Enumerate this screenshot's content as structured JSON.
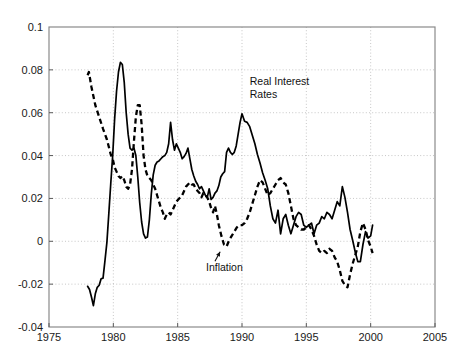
{
  "figure": {
    "width": 468,
    "height": 364,
    "background": "#ffffff",
    "plot_area": {
      "left": 49,
      "top": 27,
      "right": 435,
      "bottom": 327
    }
  },
  "annotations": {
    "real_rates_line1": "Real Interest",
    "real_rates_line2": "Rates",
    "inflation_label": "Inflation"
  },
  "chart_data": {
    "type": "line",
    "title": "",
    "xlabel": "",
    "ylabel": "",
    "xlim": [
      1975,
      2005
    ],
    "ylim": [
      -0.04,
      0.1
    ],
    "grid": true,
    "legend_position": "inline-annotation",
    "xticks": [
      1975,
      1980,
      1985,
      1990,
      1995,
      2000,
      2005
    ],
    "xtick_labels": [
      "1975",
      "1980",
      "1985",
      "1990",
      "1995",
      "2000",
      "2005"
    ],
    "yticks": [
      -0.04,
      -0.02,
      0,
      0.02,
      0.04,
      0.06,
      0.08,
      0.1
    ],
    "ytick_labels": [
      "-0.04",
      "-0.02",
      "0",
      "0.02",
      "0.04",
      "0.06",
      "0.08",
      "0.1"
    ],
    "series": [
      {
        "name": "Real Interest Rates",
        "style": "solid",
        "color": "#000000",
        "x": [
          1978.0,
          1978.15,
          1978.3,
          1978.45,
          1978.6,
          1978.75,
          1978.9,
          1979.05,
          1979.2,
          1979.35,
          1979.5,
          1979.65,
          1979.8,
          1979.95,
          1980.1,
          1980.25,
          1980.4,
          1980.55,
          1980.7,
          1980.85,
          1981.0,
          1981.15,
          1981.3,
          1981.45,
          1981.6,
          1981.75,
          1981.9,
          1982.05,
          1982.2,
          1982.35,
          1982.5,
          1982.65,
          1982.8,
          1982.95,
          1983.1,
          1983.25,
          1983.4,
          1983.55,
          1983.7,
          1983.85,
          1984.0,
          1984.15,
          1984.3,
          1984.45,
          1984.6,
          1984.75,
          1984.9,
          1985.05,
          1985.2,
          1985.35,
          1985.5,
          1985.65,
          1985.8,
          1985.95,
          1986.1,
          1986.25,
          1986.4,
          1986.55,
          1986.7,
          1986.85,
          1987.0,
          1987.15,
          1987.3,
          1987.45,
          1987.6,
          1987.75,
          1987.9,
          1988.05,
          1988.2,
          1988.35,
          1988.5,
          1988.65,
          1988.8,
          1988.95,
          1989.1,
          1989.25,
          1989.4,
          1989.55,
          1989.7,
          1989.85,
          1990.0,
          1990.2,
          1990.4,
          1990.6,
          1990.8,
          1991.0,
          1991.2,
          1991.4,
          1991.6,
          1991.8,
          1992.0,
          1992.2,
          1992.4,
          1992.6,
          1992.8,
          1993.0,
          1993.2,
          1993.4,
          1993.6,
          1993.8,
          1994.0,
          1994.2,
          1994.4,
          1994.6,
          1994.8,
          1995.0,
          1995.2,
          1995.4,
          1995.6,
          1995.8,
          1996.0,
          1996.2,
          1996.4,
          1996.6,
          1996.8,
          1997.0,
          1997.2,
          1997.4,
          1997.6,
          1997.8,
          1998.0,
          1998.2,
          1998.4,
          1998.6,
          1998.8,
          1999.0,
          1999.2,
          1999.4,
          1999.6,
          1999.8,
          2000.0,
          2000.15
        ],
        "y": [
          -0.021,
          -0.0225,
          -0.026,
          -0.03,
          -0.0245,
          -0.0215,
          -0.0205,
          -0.0175,
          -0.0172,
          -0.009,
          -0.0005,
          0.013,
          0.027,
          0.04,
          0.057,
          0.07,
          0.079,
          0.0835,
          0.0825,
          0.074,
          0.06,
          0.05,
          0.0435,
          0.0425,
          0.0435,
          0.04,
          0.03,
          0.018,
          0.009,
          0.0035,
          0.0015,
          0.002,
          0.01,
          0.022,
          0.031,
          0.0355,
          0.037,
          0.0375,
          0.0385,
          0.0395,
          0.04,
          0.0415,
          0.0455,
          0.0555,
          0.0475,
          0.0425,
          0.0455,
          0.0435,
          0.0415,
          0.0385,
          0.0395,
          0.041,
          0.0435,
          0.0385,
          0.0335,
          0.0305,
          0.028,
          0.0265,
          0.0245,
          0.0255,
          0.0235,
          0.0215,
          0.0205,
          0.0245,
          0.0195,
          0.0205,
          0.0225,
          0.0235,
          0.026,
          0.03,
          0.0315,
          0.0325,
          0.0415,
          0.0435,
          0.0415,
          0.0405,
          0.0415,
          0.0445,
          0.05,
          0.0555,
          0.0595,
          0.056,
          0.0555,
          0.0535,
          0.0495,
          0.0455,
          0.0405,
          0.0365,
          0.032,
          0.0285,
          0.0245,
          0.0165,
          0.0105,
          0.0085,
          0.0145,
          0.0035,
          0.0105,
          0.0125,
          0.0075,
          0.0035,
          0.0075,
          0.0115,
          0.0135,
          0.0125,
          0.0075,
          0.0065,
          0.0075,
          0.0085,
          0.0035,
          0.0075,
          0.0085,
          0.0115,
          0.0105,
          0.0135,
          0.0125,
          0.0105,
          0.0145,
          0.0185,
          0.0165,
          0.0255,
          0.0205,
          0.0135,
          0.0055,
          0.0005,
          -0.005,
          -0.0095,
          -0.0095,
          -0.0015,
          0.0045,
          0.0015,
          0.0025,
          0.0075
        ]
      },
      {
        "name": "Inflation",
        "style": "dashed",
        "color": "#000000",
        "x": [
          1978.0,
          1978.1,
          1978.3,
          1978.6,
          1978.9,
          1979.2,
          1979.5,
          1979.8,
          1979.95,
          1980.1,
          1980.25,
          1980.4,
          1980.55,
          1980.7,
          1980.85,
          1981.0,
          1981.15,
          1981.3,
          1981.45,
          1981.6,
          1981.75,
          1981.9,
          1982.05,
          1982.2,
          1982.35,
          1982.5,
          1982.65,
          1982.8,
          1982.95,
          1983.1,
          1983.25,
          1983.4,
          1983.55,
          1983.7,
          1983.85,
          1984.0,
          1984.15,
          1984.3,
          1984.45,
          1984.6,
          1984.75,
          1984.9,
          1985.05,
          1985.2,
          1985.35,
          1985.5,
          1985.65,
          1985.8,
          1985.95,
          1986.1,
          1986.25,
          1986.4,
          1986.55,
          1986.7,
          1986.85,
          1987.0,
          1987.15,
          1987.3,
          1987.45,
          1987.6,
          1987.75,
          1987.9,
          1988.05,
          1988.2,
          1988.4,
          1988.6,
          1988.8,
          1989.0,
          1989.2,
          1989.4,
          1989.6,
          1989.8,
          1990.0,
          1990.2,
          1990.4,
          1990.6,
          1990.8,
          1991.0,
          1991.2,
          1991.4,
          1991.6,
          1991.8,
          1992.0,
          1992.2,
          1992.4,
          1992.6,
          1992.8,
          1993.0,
          1993.2,
          1993.4,
          1993.6,
          1993.8,
          1994.0,
          1994.2,
          1994.4,
          1994.6,
          1994.8,
          1995.0,
          1995.2,
          1995.4,
          1995.6,
          1995.8,
          1996.0,
          1996.2,
          1996.4,
          1996.6,
          1996.8,
          1997.0,
          1997.2,
          1997.4,
          1997.6,
          1997.8,
          1998.0,
          1998.2,
          1998.4,
          1998.6,
          1998.8,
          1999.0,
          1999.2,
          1999.4,
          1999.6,
          1999.8,
          2000.0,
          2000.15
        ],
        "y": [
          0.0775,
          0.079,
          0.072,
          0.0635,
          0.058,
          0.0525,
          0.0475,
          0.0405,
          0.0385,
          0.0345,
          0.0325,
          0.0305,
          0.0295,
          0.0305,
          0.0285,
          0.0255,
          0.0245,
          0.0265,
          0.0335,
          0.0465,
          0.058,
          0.0635,
          0.0635,
          0.0545,
          0.04,
          0.0335,
          0.0305,
          0.0295,
          0.0285,
          0.0265,
          0.0245,
          0.0215,
          0.0185,
          0.0155,
          0.0135,
          0.0105,
          0.0125,
          0.0135,
          0.0125,
          0.0145,
          0.0165,
          0.0185,
          0.0195,
          0.0205,
          0.0215,
          0.0235,
          0.0255,
          0.0265,
          0.0275,
          0.0265,
          0.0265,
          0.0245,
          0.0235,
          0.0225,
          0.0205,
          0.0225,
          0.0215,
          0.0205,
          0.0185,
          0.0155,
          0.0135,
          0.0165,
          0.0125,
          0.0075,
          0.0025,
          -0.0015,
          -0.0025,
          0.0005,
          0.0025,
          0.0045,
          0.0065,
          0.0075,
          0.0075,
          0.0085,
          0.0105,
          0.0135,
          0.0175,
          0.0215,
          0.0255,
          0.0285,
          0.0275,
          0.0245,
          0.0215,
          0.0225,
          0.0245,
          0.0265,
          0.0285,
          0.0295,
          0.0275,
          0.0265,
          0.0225,
          0.0165,
          0.0105,
          0.0075,
          0.0065,
          0.0055,
          0.0055,
          0.0065,
          0.0075,
          0.0055,
          0.0025,
          -0.0015,
          -0.0045,
          -0.0055,
          -0.0045,
          -0.0055,
          -0.0035,
          -0.0045,
          -0.0075,
          -0.0095,
          -0.0135,
          -0.0185,
          -0.0205,
          -0.0215,
          -0.0155,
          -0.0105,
          -0.0065,
          -0.0025,
          0.0045,
          0.0085,
          0.0055,
          0.0005,
          -0.0025,
          -0.0055
        ]
      }
    ],
    "annotations": [
      {
        "text": "Real Interest Rates",
        "x": 1990.6,
        "y": 0.073
      },
      {
        "text": "Inflation",
        "x": 1987.2,
        "y": -0.014,
        "arrow_to_x": 1988.3,
        "arrow_to_y": -0.0035
      }
    ]
  }
}
